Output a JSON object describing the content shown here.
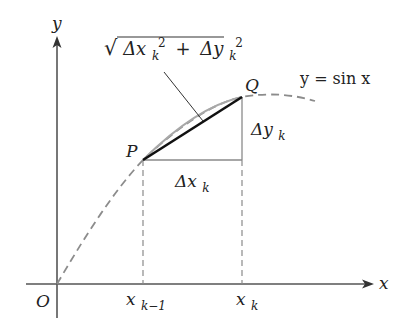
{
  "diagram": {
    "colors": {
      "axis": "#555555",
      "curve_dashed": "#8c8c8c",
      "arc_solid": "#a8a8a8",
      "chord": "#111111",
      "guides": "#8a8a8a",
      "text": "#222222"
    },
    "axes": {
      "x_label": "x",
      "y_label": "y",
      "origin_label": "O"
    },
    "points": {
      "P": "P",
      "Q": "Q"
    },
    "labels": {
      "curve": "y = sin x",
      "delta_x": "Δx",
      "delta_x_sub": "k",
      "delta_y": "Δy",
      "delta_y_sub": "k",
      "x_k_minus_1": "x",
      "x_k_minus_1_sub": "k−1",
      "x_k": "x",
      "x_k_sub": "k"
    },
    "formula": {
      "radical": "√",
      "dx": "Δx",
      "dx_sub": "k",
      "dx_sup": "2",
      "plus": "+",
      "dy": "Δy",
      "dy_sub": "k",
      "dy_sup": "2"
    }
  }
}
